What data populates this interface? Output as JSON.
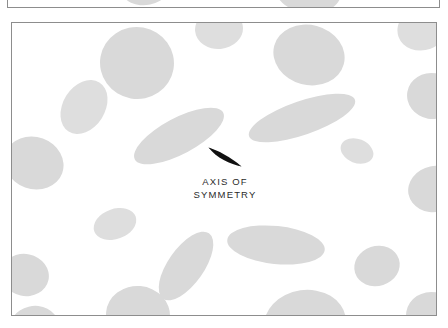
{
  "page": {
    "background_color": "#ffffff",
    "width": 448,
    "height": 328
  },
  "top_figure": {
    "name": "partial-figure-above",
    "border_color": "#8d8d8d",
    "background_color": "#ffffff",
    "blobs": [
      {
        "cx": 145,
        "cy": 22,
        "rx": 26,
        "ry": 20,
        "rot": -12
      },
      {
        "cx": 307,
        "cy": 28,
        "rx": 33,
        "ry": 22,
        "rot": 8
      }
    ]
  },
  "main_figure": {
    "name": "grain-structure-micrograph",
    "border_color": "#8d8d8d",
    "background_color": "#ffffff",
    "blob_color": "#d9d9d9",
    "blob_color_alt": "#dedede",
    "blobs": [
      {
        "cx": 125,
        "cy": 40,
        "rx": 37,
        "ry": 36,
        "rot": 10
      },
      {
        "cx": 207,
        "cy": 6,
        "rx": 24,
        "ry": 20,
        "rot": -5
      },
      {
        "cx": 297,
        "cy": 32,
        "rx": 36,
        "ry": 30,
        "rot": 15
      },
      {
        "cx": 411,
        "cy": 5,
        "rx": 26,
        "ry": 22,
        "rot": -20
      },
      {
        "cx": 420,
        "cy": 73,
        "rx": 25,
        "ry": 23,
        "rot": 10
      },
      {
        "cx": 72,
        "cy": 84,
        "rx": 29,
        "ry": 21,
        "rot": -58
      },
      {
        "cx": 290,
        "cy": 95,
        "rx": 56,
        "ry": 17,
        "rot": -19
      },
      {
        "cx": 22,
        "cy": 140,
        "rx": 30,
        "ry": 26,
        "rot": 20
      },
      {
        "cx": 167,
        "cy": 113,
        "rx": 50,
        "ry": 18,
        "rot": -28
      },
      {
        "cx": 345,
        "cy": 128,
        "rx": 17,
        "ry": 12,
        "rot": 22
      },
      {
        "cx": 423,
        "cy": 166,
        "rx": 27,
        "ry": 23,
        "rot": -12
      },
      {
        "cx": 103,
        "cy": 201,
        "rx": 22,
        "ry": 15,
        "rot": -20
      },
      {
        "cx": 264,
        "cy": 222,
        "rx": 49,
        "ry": 19,
        "rot": 6
      },
      {
        "cx": 174,
        "cy": 243,
        "rx": 40,
        "ry": 18,
        "rot": -55
      },
      {
        "cx": 13,
        "cy": 252,
        "rx": 24,
        "ry": 21,
        "rot": 12
      },
      {
        "cx": 365,
        "cy": 243,
        "rx": 23,
        "ry": 20,
        "rot": -18
      },
      {
        "cx": 126,
        "cy": 292,
        "rx": 32,
        "ry": 29,
        "rot": 5
      },
      {
        "cx": 293,
        "cy": 300,
        "rx": 41,
        "ry": 33,
        "rot": -8
      },
      {
        "cx": 22,
        "cy": 305,
        "rx": 25,
        "ry": 22,
        "rot": -14
      },
      {
        "cx": 420,
        "cy": 293,
        "rx": 26,
        "ry": 24,
        "rot": 10
      }
    ]
  },
  "annotation": {
    "marker_name": "axis-of-symmetry-marker",
    "marker_color": "#111111",
    "caption_line_1": "AXIS OF",
    "caption_line_2": "SYMMETRY",
    "caption": "AXIS OF\nSYMMETRY"
  }
}
